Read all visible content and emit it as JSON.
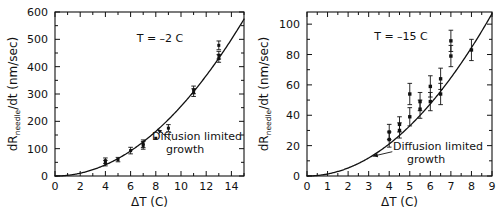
{
  "figure": {
    "background": "#ffffff",
    "ink": "#111111",
    "panel_count": 2
  },
  "chart_data": [
    {
      "id": "panel-left",
      "type": "scatter",
      "title": "",
      "condition_label": "T = –2 C",
      "xlabel": "ΔT (C)",
      "ylabel": "dRneedle/dt (nm/sec)",
      "ylabel_main": "dR",
      "ylabel_sub": "needle",
      "ylabel_rest": "/dt  (nm/sec)",
      "xlim": [
        0,
        15
      ],
      "ylim": [
        0,
        600
      ],
      "xticks": [
        0,
        2,
        4,
        6,
        8,
        10,
        12,
        14
      ],
      "xticklabels": [
        "0",
        "2",
        "4",
        "6",
        "8",
        "10",
        "12",
        "14"
      ],
      "xminor_step": 1,
      "yticks": [
        0,
        100,
        200,
        300,
        400,
        500,
        600
      ],
      "yticklabels": [
        "0",
        "100",
        "200",
        "300",
        "400",
        "500",
        "600"
      ],
      "yminor_step": 50,
      "grid": false,
      "legend": false,
      "marker": "filled-square",
      "errorbars": true,
      "points": [
        {
          "x": 4.0,
          "y": 56,
          "yerr": 10
        },
        {
          "x": 4.0,
          "y": 47,
          "yerr": 10
        },
        {
          "x": 5.0,
          "y": 60,
          "yerr": 8
        },
        {
          "x": 6.0,
          "y": 93,
          "yerr": 12
        },
        {
          "x": 7.0,
          "y": 118,
          "yerr": 14
        },
        {
          "x": 7.0,
          "y": 112,
          "yerr": 14
        },
        {
          "x": 8.0,
          "y": 138,
          "yerr": 0
        },
        {
          "x": 9.0,
          "y": 175,
          "yerr": 13
        },
        {
          "x": 11.0,
          "y": 315,
          "yerr": 14
        },
        {
          "x": 11.0,
          "y": 305,
          "yerr": 14
        },
        {
          "x": 13.0,
          "y": 478,
          "yerr": 16
        },
        {
          "x": 13.0,
          "y": 442,
          "yerr": 14
        },
        {
          "x": 13.0,
          "y": 430,
          "yerr": 14
        }
      ],
      "curve": {
        "label": "Diffusion limited growth",
        "label_line1": "Diffusion limited",
        "label_line2": "growth",
        "model": "power",
        "coefficient": 2.55,
        "exponent": 2.0,
        "note": "dR/dt = 2.55 * (ΔT)^2"
      },
      "annotation": {
        "text_line1": "Diffusion limited",
        "text_line2": "growth",
        "arrow_from_x": 9.2,
        "arrow_from_y": 130,
        "arrow_to_x": 8.1,
        "arrow_to_y": 172
      }
    },
    {
      "id": "panel-right",
      "type": "scatter",
      "title": "",
      "condition_label": "T = –15 C",
      "xlabel": "ΔT (C)",
      "ylabel": "dRneedle/dt (nm/sec)",
      "ylabel_main": "dR",
      "ylabel_sub": "needle",
      "ylabel_rest": "/dt  (nm/sec)",
      "xlim": [
        0,
        9
      ],
      "ylim": [
        0,
        108
      ],
      "xticks": [
        0,
        1,
        2,
        3,
        4,
        5,
        6,
        7,
        8,
        9
      ],
      "xticklabels": [
        "0",
        "1",
        "2",
        "3",
        "4",
        "5",
        "6",
        "7",
        "8",
        "9"
      ],
      "xminor_step": 0.5,
      "yticks": [
        0,
        20,
        40,
        60,
        80,
        100
      ],
      "yticklabels": [
        "0",
        "20",
        "40",
        "60",
        "80",
        "100"
      ],
      "yminor_step": 10,
      "grid": false,
      "legend": false,
      "marker": "filled-square",
      "errorbars": true,
      "points": [
        {
          "x": 4.0,
          "y": 29,
          "yerr": 5
        },
        {
          "x": 4.0,
          "y": 24,
          "yerr": 5
        },
        {
          "x": 4.5,
          "y": 34,
          "yerr": 5
        },
        {
          "x": 4.5,
          "y": 30,
          "yerr": 5
        },
        {
          "x": 5.0,
          "y": 54,
          "yerr": 7
        },
        {
          "x": 5.0,
          "y": 39,
          "yerr": 6
        },
        {
          "x": 5.5,
          "y": 49,
          "yerr": 6
        },
        {
          "x": 5.5,
          "y": 44,
          "yerr": 6
        },
        {
          "x": 6.0,
          "y": 59,
          "yerr": 7
        },
        {
          "x": 6.0,
          "y": 49,
          "yerr": 6
        },
        {
          "x": 6.5,
          "y": 64,
          "yerr": 7
        },
        {
          "x": 6.5,
          "y": 54,
          "yerr": 7
        },
        {
          "x": 7.0,
          "y": 89,
          "yerr": 7
        },
        {
          "x": 7.0,
          "y": 79,
          "yerr": 7
        },
        {
          "x": 8.0,
          "y": 83,
          "yerr": 7
        }
      ],
      "curve": {
        "label": "Diffusion limited growth",
        "label_line1": "Diffusion limited",
        "label_line2": "growth",
        "model": "power",
        "coefficient": 1.32,
        "exponent": 2.0,
        "note": "dR/dt = 1.32 * (ΔT)^2"
      },
      "annotation": {
        "text_line1": "Diffusion limited",
        "text_line2": "growth",
        "arrow_from_x": 4.15,
        "arrow_from_y": 16,
        "arrow_to_x": 3.2,
        "arrow_to_y": 13
      }
    }
  ]
}
